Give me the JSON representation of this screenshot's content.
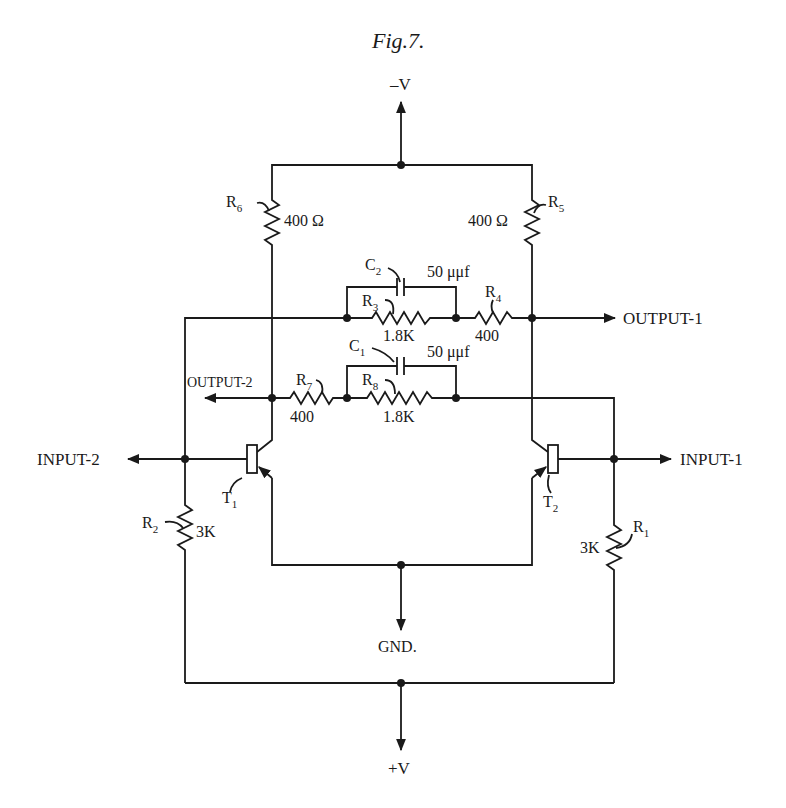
{
  "figure": {
    "title": "Fig.7."
  },
  "supplies": {
    "neg_v": "–V",
    "pos_v": "+V",
    "gnd": "GND."
  },
  "ports": {
    "input_1": "INPUT-1",
    "input_2": "INPUT-2",
    "output_1": "OUTPUT-1",
    "output_2": "OUTPUT-2"
  },
  "components": {
    "R1": {
      "name": "R",
      "sub": "1",
      "value": "3K"
    },
    "R2": {
      "name": "R",
      "sub": "2",
      "value": "3K"
    },
    "R3": {
      "name": "R",
      "sub": "3",
      "value": "1.8K"
    },
    "R4": {
      "name": "R",
      "sub": "4",
      "value": "400"
    },
    "R5": {
      "name": "R",
      "sub": "5",
      "value": "400 Ω"
    },
    "R6": {
      "name": "R",
      "sub": "6",
      "value": "400 Ω"
    },
    "R7": {
      "name": "R",
      "sub": "7",
      "value": "400"
    },
    "R8": {
      "name": "R",
      "sub": "8",
      "value": "1.8K"
    },
    "C1": {
      "name": "C",
      "sub": "1",
      "value": "50 μμf"
    },
    "C2": {
      "name": "C",
      "sub": "2",
      "value": "50 μμf"
    },
    "T1": {
      "name": "T",
      "sub": "1"
    },
    "T2": {
      "name": "T",
      "sub": "2"
    }
  },
  "colors": {
    "ink": "#1a1a1a",
    "background": "#ffffff"
  }
}
